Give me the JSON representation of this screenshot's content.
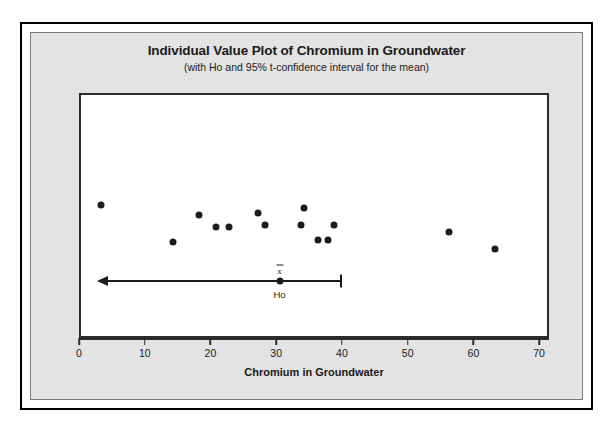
{
  "chart_data": {
    "type": "scatter",
    "title": "Individual Value Plot of Chromium in Groundwater",
    "subtitle": "(with Ho and 95% t-confidence interval for the mean)",
    "xlabel": "Chromium in Groundwater",
    "ylabel": "",
    "xlim": [
      0,
      71.5
    ],
    "xticks": [
      0,
      10,
      20,
      30,
      40,
      50,
      60,
      70
    ],
    "xtick_labels": [
      "0",
      "10",
      "20",
      "30",
      "40",
      "50",
      "60",
      "70"
    ],
    "grid": false,
    "legend": "none",
    "marker": "filled-circle",
    "marker_color": "#1c1c1c",
    "series": [
      {
        "name": "Chromium in Groundwater",
        "values": [
          3,
          14,
          18,
          20.5,
          22.5,
          27,
          28,
          33.5,
          34,
          36,
          37.5,
          38.5,
          56,
          63
        ],
        "jitter_y": [
          45,
          60,
          49,
          54,
          54,
          48,
          53,
          53,
          46,
          59,
          59,
          53,
          56,
          63
        ]
      }
    ],
    "annotations": {
      "mean_symbol": "x̄",
      "mean_value": 30.2,
      "ho_label": "Ho",
      "ci_left_bound": "-inf",
      "ci_right_bound": 39.5,
      "ci_arrow_direction": "left",
      "ci_level": "95%"
    }
  },
  "colors": {
    "panel_background": "#e3e3e3",
    "plot_background": "#ffffff",
    "frame": "#000000",
    "axis": "#2b2b2b",
    "text": "#1a1a1a",
    "marker": "#1c1c1c"
  }
}
